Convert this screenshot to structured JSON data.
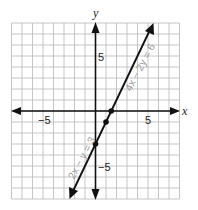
{
  "chart_data": {
    "type": "line",
    "title": "",
    "xlabel": "x",
    "ylabel": "y",
    "xlim": [
      -8,
      8
    ],
    "ylim": [
      -8,
      8
    ],
    "grid": true,
    "grid_step": 1,
    "x_tick_labels": [
      {
        "value": -5,
        "label": "−5"
      },
      {
        "value": 5,
        "label": "5"
      }
    ],
    "y_tick_labels": [
      {
        "value": 5,
        "label": "5"
      },
      {
        "value": -5,
        "label": "−5"
      }
    ],
    "series": [
      {
        "name": "2x − y = 3",
        "equivalent_name": "4x − 2y = 6",
        "equation": "y = 2x - 3",
        "x_range": [
          -2.45,
          5.45
        ],
        "arrows": "both",
        "points": [
          {
            "x": 0,
            "y": -3
          },
          {
            "x": 1,
            "y": -1
          },
          {
            "x": 1.5,
            "y": 0
          }
        ]
      }
    ],
    "annotations": [
      {
        "text": "4x − 2y = 6",
        "position": "along line, upper right side"
      },
      {
        "text": "2x − y = 3",
        "position": "along line, lower left side"
      }
    ]
  },
  "labels": {
    "x_axis": "x",
    "y_axis": "y",
    "x_neg5": "−5",
    "x_pos5": "5",
    "y_pos5": "5",
    "y_neg5": "−5",
    "eq_upper": "4x − 2y = 6",
    "eq_lower": "2x − y = 3"
  },
  "colors": {
    "grid": "#b8b8b8",
    "axis": "#111111",
    "line": "#111111",
    "equation_label": "#9a9a9a"
  }
}
